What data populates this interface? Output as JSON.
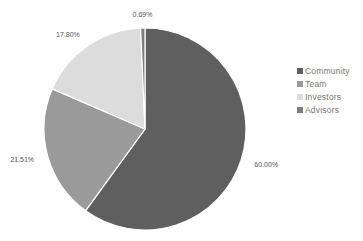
{
  "chart_data": {
    "type": "pie",
    "title": "",
    "categories": [
      "Community",
      "Team",
      "Investors",
      "Advisors"
    ],
    "values": [
      60.0,
      21.51,
      17.8,
      0.69
    ],
    "labels": [
      "60.00%",
      "21.51%",
      "17.80%",
      "0.69%"
    ],
    "colors": [
      "#5f5f5f",
      "#9a9a9a",
      "#dcdcdc",
      "#7c7c7c"
    ],
    "start_angle_deg": 0,
    "direction": "clockwise",
    "legend_position": "right"
  },
  "legend": {
    "items": [
      {
        "label": "Community",
        "color": "#5f5f5f"
      },
      {
        "label": "Team",
        "color": "#9a9a9a"
      },
      {
        "label": "Investors",
        "color": "#dcdcdc"
      },
      {
        "label": "Advisors",
        "color": "#7c7c7c"
      }
    ]
  }
}
